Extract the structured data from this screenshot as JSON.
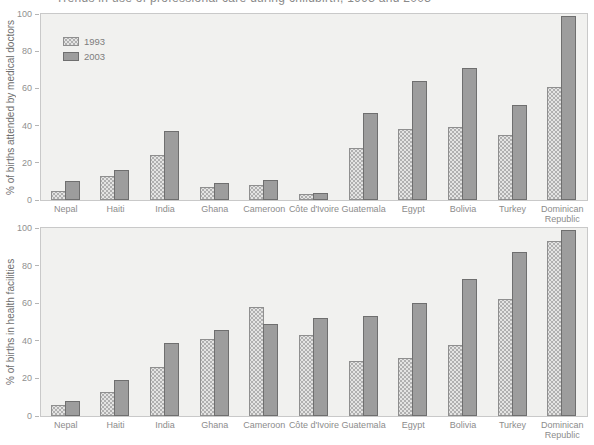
{
  "page": {
    "clipped_title": "Trends in use of professional care during childbirth, 1993 and 2003"
  },
  "legend": {
    "position": "top-left-of-upper-panel",
    "items": [
      {
        "label": "1993",
        "color": "#e4e4e3",
        "pattern": "stipple"
      },
      {
        "label": "2003",
        "color": "#9d9d9d",
        "pattern": "solid"
      }
    ]
  },
  "colors": {
    "plot_background": "#f1f1ef",
    "plot_border": "#c9c9c9",
    "bar_1993_fill": "#e4e4e3",
    "bar_1993_border": "#8f8f8f",
    "bar_2003_fill": "#9d9d9d",
    "bar_2003_border": "#6f6f6f",
    "tick_text": "#909090",
    "axis_title_text": "#6e6e6e"
  },
  "chart_data": [
    {
      "type": "bar",
      "title": "",
      "ylabel": "% of births attended by medical doctors",
      "xlabel": "",
      "ylim": [
        0,
        100
      ],
      "yticks": [
        0,
        20,
        40,
        60,
        80,
        100
      ],
      "grid": false,
      "legend_position": "upper left",
      "categories": [
        "Nepal",
        "Haiti",
        "India",
        "Ghana",
        "Cameroon",
        "Côte d'Ivoire",
        "Guatemala",
        "Egypt",
        "Bolivia",
        "Turkey",
        "Dominican Republic"
      ],
      "series": [
        {
          "name": "1993",
          "values": [
            5,
            13,
            24,
            7,
            8,
            3,
            28,
            38,
            39,
            35,
            61
          ]
        },
        {
          "name": "2003",
          "values": [
            10,
            16,
            37,
            9,
            11,
            4,
            47,
            64,
            71,
            51,
            99
          ]
        }
      ]
    },
    {
      "type": "bar",
      "title": "",
      "ylabel": "% of births in health facilities",
      "xlabel": "",
      "ylim": [
        0,
        100
      ],
      "yticks": [
        0,
        20,
        40,
        60,
        80,
        100
      ],
      "grid": false,
      "legend_position": "none",
      "categories": [
        "Nepal",
        "Haiti",
        "India",
        "Ghana",
        "Cameroon",
        "Côte d'Ivoire",
        "Guatemala",
        "Egypt",
        "Bolivia",
        "Turkey",
        "Dominican Republic"
      ],
      "series": [
        {
          "name": "1993",
          "values": [
            6,
            13,
            26,
            41,
            58,
            43,
            29,
            31,
            38,
            62,
            93
          ]
        },
        {
          "name": "2003",
          "values": [
            8,
            19,
            39,
            46,
            49,
            52,
            53,
            60,
            73,
            87,
            99
          ]
        }
      ]
    }
  ]
}
